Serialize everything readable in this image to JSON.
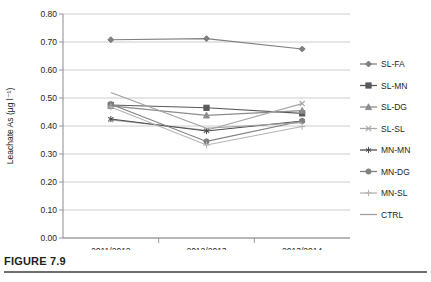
{
  "figure": {
    "caption": "FIGURE 7.9"
  },
  "chart_data": {
    "type": "line",
    "title": "",
    "xlabel": "",
    "ylabel": "Leachate As (µg l⁻¹)",
    "categories": [
      "2011/2012",
      "2012/2013",
      "2013/2014"
    ],
    "ylim": [
      0.0,
      0.8
    ],
    "ytick_step": 0.1,
    "ytick_labels": [
      "0.00",
      "0.10",
      "0.20",
      "0.30",
      "0.40",
      "0.50",
      "0.60",
      "0.70",
      "0.80"
    ],
    "ytick_values": [
      0.0,
      0.1,
      0.2,
      0.3,
      0.4,
      0.5,
      0.6,
      0.7,
      0.8
    ],
    "grid": true,
    "legend_position": "right",
    "series": [
      {
        "name": "SL-FA",
        "marker": "diamond",
        "color": "#7f7f7f",
        "values": [
          0.708,
          0.712,
          0.675
        ]
      },
      {
        "name": "SL-MN",
        "marker": "square",
        "color": "#595959",
        "values": [
          0.475,
          0.465,
          0.445
        ]
      },
      {
        "name": "SL-DG",
        "marker": "triangle",
        "color": "#8c8c8c",
        "values": [
          0.472,
          0.438,
          0.455
        ]
      },
      {
        "name": "SL-SL",
        "marker": "x",
        "color": "#a6a6a6",
        "values": [
          0.422,
          0.385,
          0.48
        ]
      },
      {
        "name": "MN-MN",
        "marker": "asterisk",
        "color": "#4d4d4d",
        "values": [
          0.425,
          0.382,
          0.418
        ]
      },
      {
        "name": "MN-DG",
        "marker": "circle",
        "color": "#808080",
        "values": [
          0.478,
          0.345,
          0.418
        ]
      },
      {
        "name": "MN-SL",
        "marker": "plus",
        "color": "#b3b3b3",
        "values": [
          0.468,
          0.332,
          0.398
        ]
      },
      {
        "name": "CTRL",
        "marker": "none",
        "color": "#a0a0a0",
        "values": [
          0.52,
          0.392,
          0.412
        ]
      }
    ]
  }
}
